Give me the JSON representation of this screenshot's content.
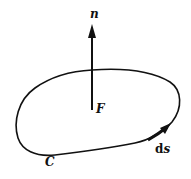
{
  "diagram": {
    "title": "",
    "labels": {
      "normal": "n",
      "point": "F",
      "curve": "C",
      "ds_d": "d",
      "ds_s": "s"
    },
    "colors": {
      "stroke": "#111111",
      "background": "#ffffff"
    },
    "elements": [
      {
        "type": "closed-curve",
        "label": "C"
      },
      {
        "type": "vector-arrow",
        "label": "n",
        "origin_label": "F",
        "direction": "up"
      },
      {
        "type": "tangent-arrow",
        "label": "ds",
        "on": "C"
      }
    ]
  }
}
